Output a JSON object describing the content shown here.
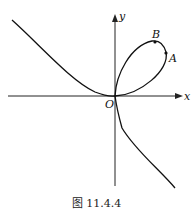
{
  "figure": {
    "caption": "图 11.4.4",
    "axes": {
      "x_label": "x",
      "y_label": "y",
      "origin_label": "O"
    },
    "points": [
      {
        "label": "A"
      },
      {
        "label": "B"
      }
    ],
    "curve": "folium of Descartes"
  }
}
